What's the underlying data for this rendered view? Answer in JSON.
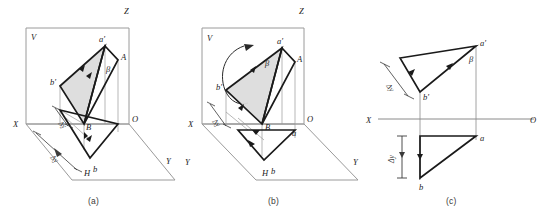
{
  "figure": {
    "kind": "descriptive-geometry-projection-diagram",
    "panel_count": 3
  },
  "captions": {
    "a": "(a)",
    "b": "(b)",
    "c": "(c)"
  },
  "panel_a": {
    "axes": {
      "x": "X",
      "y": "Y",
      "z": "Z",
      "origin": "O"
    },
    "planes": {
      "vertical": "V",
      "horizontal": "H"
    },
    "points": {
      "a_prime": "a'",
      "b_prime": "b'",
      "A": "A",
      "B": "B",
      "b": "b"
    },
    "angles": {
      "beta": "β"
    },
    "dimensions": {
      "delta_y_lower": "Δy",
      "delta_y_upper": "Δy"
    }
  },
  "panel_b": {
    "axes": {
      "x": "X",
      "y_left": "Y",
      "y_right": "Y",
      "z": "Z",
      "origin": "O"
    },
    "planes": {
      "vertical": "V",
      "horizontal": "H"
    },
    "points": {
      "a_prime": "a'",
      "b_prime": "b'",
      "A": "A",
      "B": "B",
      "a": "a",
      "b": "b"
    },
    "angles": {
      "beta": "β"
    },
    "dimensions": {
      "delta_y": "Δy"
    },
    "annotations": {
      "rotation_arrow": "rotation-arrow"
    }
  },
  "panel_c": {
    "axes": {
      "x": "X",
      "origin": "O"
    },
    "points": {
      "a_prime": "a'",
      "b_prime": "b'",
      "a": "a",
      "b": "b"
    },
    "angles": {
      "beta": "β"
    },
    "dimensions": {
      "delta_y_upper": "Δy",
      "delta_y_lower": "Δy"
    }
  },
  "colors": {
    "stroke_heavy": "#1a1a1a",
    "stroke_light": "#8a8a8a",
    "fill_hatch": "#d8d8d8",
    "background": "#ffffff"
  }
}
